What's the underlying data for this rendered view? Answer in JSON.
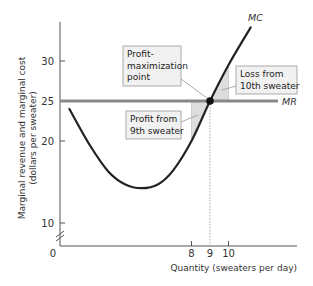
{
  "chart_data": {
    "type": "line",
    "title": "",
    "xlabel": "Quantity (sweaters per day)",
    "ylabel_line1": "Marginal revenue and marginal cost",
    "ylabel_line2": "(dollars per sweater)",
    "y_ticks": [
      {
        "value": 10,
        "label": "10"
      },
      {
        "value": 20,
        "label": "20"
      },
      {
        "value": 25,
        "label": "25"
      },
      {
        "value": 30,
        "label": "30"
      }
    ],
    "x_ticks": [
      {
        "value": 8,
        "label": "8"
      },
      {
        "value": 9,
        "label": "9"
      },
      {
        "value": 10,
        "label": "10"
      }
    ],
    "origin_label": "0",
    "axis_break": true,
    "xlim": [
      0,
      12.5
    ],
    "ylim": [
      10,
      35
    ],
    "grid": false,
    "series": [
      {
        "name": "MC",
        "label": "MC",
        "color": "#222222",
        "points": [
          {
            "x": 1.4,
            "y": 24.0
          },
          {
            "x": 2.5,
            "y": 19.5
          },
          {
            "x": 3.5,
            "y": 16.2
          },
          {
            "x": 4.4,
            "y": 14.6
          },
          {
            "x": 5.3,
            "y": 14.1
          },
          {
            "x": 6.2,
            "y": 14.6
          },
          {
            "x": 7.0,
            "y": 16.3
          },
          {
            "x": 8.0,
            "y": 20.0
          },
          {
            "x": 9.0,
            "y": 25.0
          },
          {
            "x": 10.0,
            "y": 29.5
          },
          {
            "x": 11.2,
            "y": 34.2
          }
        ]
      },
      {
        "name": "MR",
        "label": "MR",
        "color": "#888888",
        "points": [
          {
            "x": 0,
            "y": 25
          },
          {
            "x": 12.5,
            "y": 25
          }
        ]
      }
    ],
    "equilibrium": {
      "x": 9,
      "y": 25
    },
    "shaded_regions": [
      {
        "name": "profit-9th-sweater",
        "x_from": 8,
        "x_to": 9,
        "color": "#dddddd"
      },
      {
        "name": "loss-10th-sweater",
        "x_from": 9,
        "x_to": 10,
        "color": "#dddddd"
      }
    ],
    "annotations": [
      {
        "id": "profit_max",
        "lines": [
          "Profit-",
          "maximization",
          "point"
        ]
      },
      {
        "id": "profit_9th",
        "lines": [
          "Profit from",
          "9th sweater"
        ]
      },
      {
        "id": "loss_10th",
        "lines": [
          "Loss from",
          "10th sweater"
        ]
      }
    ]
  }
}
